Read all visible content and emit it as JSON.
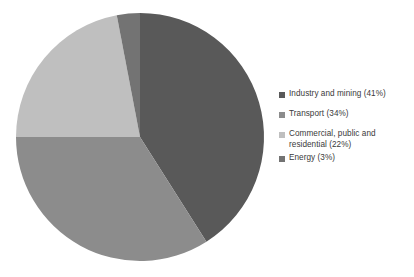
{
  "chart_data": {
    "type": "pie",
    "title": "",
    "categories": [
      "Industry and mining",
      "Transport",
      "Commercial, public and residential",
      "Energy"
    ],
    "values": [
      41,
      34,
      22,
      3
    ],
    "unit": "%",
    "legend_position": "right",
    "grid": false,
    "slices": [
      {
        "label": "Industry and mining",
        "value": 41,
        "legend_text": "Industry and mining (41%)",
        "color": "#595959",
        "start_angle": 0,
        "end_angle": 147.6
      },
      {
        "label": "Transport",
        "value": 34,
        "legend_text": "Transport (34%)",
        "color": "#8c8c8c",
        "start_angle": 147.6,
        "end_angle": 270.0
      },
      {
        "label": "Commercial, public and residential",
        "value": 22,
        "legend_text": "Commercial, public and\nresidential (22%)",
        "color": "#bfbfbf",
        "start_angle": 270.0,
        "end_angle": 349.2
      },
      {
        "label": "Energy",
        "value": 3,
        "legend_text": "Energy (3%)",
        "color": "#737373",
        "start_angle": 349.2,
        "end_angle": 360.0
      }
    ]
  },
  "legend": {
    "items": [
      {
        "label": "Industry and mining (41%)",
        "color": "#595959"
      },
      {
        "label": "Transport (34%)",
        "color": "#8c8c8c"
      },
      {
        "label": "Commercial, public and\nresidential (22%)",
        "color": "#bfbfbf"
      },
      {
        "label": "Energy (3%)",
        "color": "#737373"
      }
    ]
  },
  "geometry": {
    "center_x": 140,
    "center_y": 137,
    "radius": 124
  }
}
